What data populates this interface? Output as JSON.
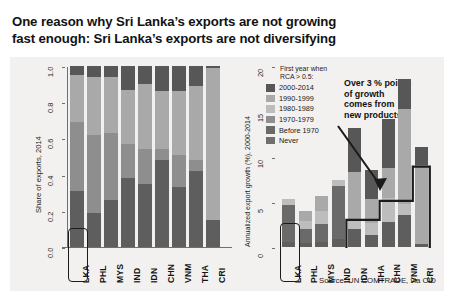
{
  "title": {
    "line1": "One reason why Sri Lanka’s exports are not growing",
    "line2": "fast enough: Sri Lanka’s exports are not diversifying"
  },
  "source": "Source: UN COMTRADE, via CID",
  "annotation": {
    "line1": "Over 3 % points",
    "line2": "of growth",
    "line3": "comes from",
    "line4": "new products"
  },
  "legend": {
    "title_line1": "First year when",
    "title_line2": "RCA > 0.5:",
    "entries": [
      {
        "label": "2000-2014",
        "color": "#575757"
      },
      {
        "label": "1990-1999",
        "color": "#a9a9a9"
      },
      {
        "label": "1980-1989",
        "color": "#bdbdbd"
      },
      {
        "label": "1970-1979",
        "color": "#8e8e8e"
      },
      {
        "label": "Before 1970",
        "color": "#6a6a6a"
      },
      {
        "label": "Never",
        "color": "#6f6f6f"
      }
    ]
  },
  "highlight": {
    "country": "LKA",
    "color": "#1b1b1b"
  },
  "chart_data": [
    {
      "type": "bar",
      "subtype": "stacked",
      "panel": "left",
      "title": "",
      "xlabel": "",
      "ylabel": "Share of exports, 2014",
      "ylim": [
        0,
        1
      ],
      "yticks": [
        "0.0",
        "0.2",
        "0.4",
        "0.6",
        "0.8",
        "1.0"
      ],
      "ytick_values": [
        0,
        0.2,
        0.4,
        0.6,
        0.8,
        1.0
      ],
      "grid": false,
      "legend_position": "right-panel",
      "categories": [
        "LKA",
        "PHL",
        "MYS",
        "IND",
        "IDN",
        "CHN",
        "VNM",
        "THA",
        "CRI"
      ],
      "series": [
        {
          "name": "2000-2014",
          "color": "#575757",
          "values": [
            0.05,
            0.06,
            0.06,
            0.13,
            0.1,
            0.14,
            0.14,
            0.11,
            0.01
          ]
        },
        {
          "name": "1990-1999",
          "color": "#a9a9a9",
          "values": [
            0.26,
            0.32,
            0.31,
            0.3,
            0.36,
            0.32,
            0.35,
            0.41,
            0.84
          ]
        },
        {
          "name": "1980-1989",
          "color": "#bdbdbd",
          "values": [
            0.0,
            0.0,
            0.0,
            0.0,
            0.0,
            0.0,
            0.0,
            0.0,
            0.0
          ]
        },
        {
          "name": "1970-1979",
          "color": "#8e8e8e",
          "values": [
            0.38,
            0.43,
            0.37,
            0.19,
            0.19,
            0.06,
            0.18,
            0.06,
            0.0
          ]
        },
        {
          "name": "Before 1970",
          "color": "#6a6a6a",
          "values": [
            0.0,
            0.0,
            0.0,
            0.0,
            0.0,
            0.0,
            0.0,
            0.0,
            0.0
          ]
        },
        {
          "name": "Never",
          "color": "#5e5e5e",
          "values": [
            0.31,
            0.19,
            0.26,
            0.38,
            0.35,
            0.48,
            0.33,
            0.42,
            0.15
          ]
        }
      ]
    },
    {
      "type": "bar",
      "subtype": "stacked",
      "panel": "right",
      "title": "",
      "xlabel": "",
      "ylabel": "Annualized export growth (%), 2000-2014",
      "ylim": [
        0,
        20
      ],
      "yticks": [
        "0",
        "5",
        "10",
        "15",
        "20"
      ],
      "ytick_values": [
        0,
        5,
        10,
        15,
        20
      ],
      "grid": false,
      "legend_position": "inside-top-left",
      "categories": [
        "LKA",
        "PHL",
        "MYS",
        "IND",
        "IDN",
        "THA",
        "CHN",
        "VNM",
        "CRI"
      ],
      "totals": [
        5.3,
        4.0,
        5.6,
        7.4,
        13.1,
        8.5,
        14.1,
        18.6,
        11.0
      ],
      "series": [
        {
          "name": "2000-2014",
          "color": "#575757",
          "values": [
            0.0,
            0.0,
            0.0,
            0.0,
            4.8,
            3.2,
            5.4,
            3.4,
            1.9
          ]
        },
        {
          "name": "1990-1999",
          "color": "#a9a9a9",
          "values": [
            0.0,
            1.1,
            1.6,
            0.0,
            5.3,
            2.7,
            3.3,
            10.4,
            8.8
          ]
        },
        {
          "name": "1980-1989",
          "color": "#bdbdbd",
          "values": [
            0.7,
            0.9,
            1.5,
            0.7,
            1.0,
            1.3,
            2.6,
            1.3,
            0.0
          ]
        },
        {
          "name": "1970-1979",
          "color": "#8e8e8e",
          "values": [
            0.0,
            0.0,
            0.0,
            0.0,
            0.0,
            0.0,
            0.0,
            0.0,
            0.0
          ]
        },
        {
          "name": "Before 1970",
          "color": "#6a6a6a",
          "values": [
            4.1,
            1.6,
            2.0,
            5.8,
            0.0,
            0.0,
            0.0,
            0.0,
            0.0
          ]
        },
        {
          "name": "Never",
          "color": "#5e5e5e",
          "values": [
            0.5,
            0.4,
            0.5,
            0.9,
            2.0,
            1.3,
            2.8,
            3.5,
            0.3
          ]
        }
      ],
      "step_outline_note": "Threshold step line rising from ~3 at IDN to ~5 at CHN to ~9 at CRI"
    }
  ]
}
